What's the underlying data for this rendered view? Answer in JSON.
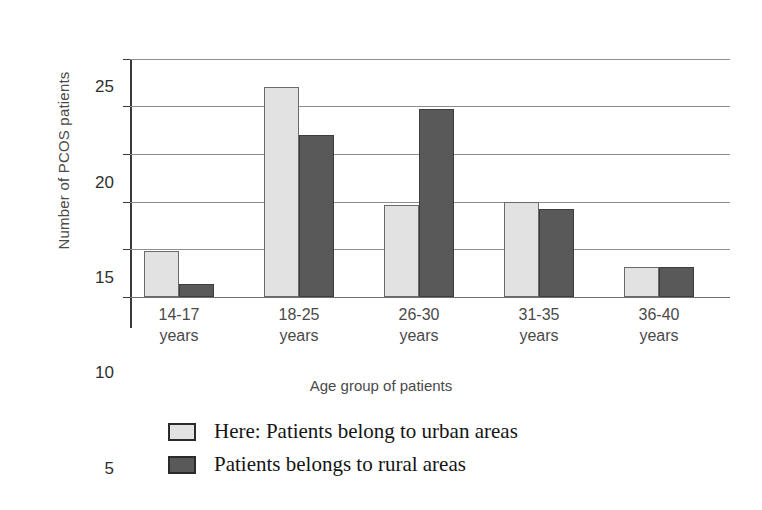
{
  "chart_data": {
    "type": "bar",
    "title": "",
    "xlabel": "Age group of patients",
    "ylabel": "Number of PCOS patients",
    "categories": [
      "14-17 years",
      "18-25 years",
      "26-30 years",
      "31-35 years",
      "36-40 years"
    ],
    "category_lines": [
      [
        "14-17",
        "years"
      ],
      [
        "18-25",
        "years"
      ],
      [
        "26-30",
        "years"
      ],
      [
        "31-35",
        "years"
      ],
      [
        "36-40",
        "years"
      ]
    ],
    "series": [
      {
        "name": "Here: Patients belong to urban areas",
        "short_name": "urban",
        "color": "#e2e2e2",
        "values": [
          4.8,
          22,
          9.7,
          10,
          3.2
        ]
      },
      {
        "name": "Patients belongs to rural areas",
        "short_name": "rural",
        "color": "#595959",
        "values": [
          1.4,
          17,
          19.7,
          9.2,
          3.2
        ]
      }
    ],
    "ylim": [
      0,
      28
    ],
    "yticks": [
      0,
      5,
      10,
      15,
      20,
      25
    ],
    "ytick_labels": [
      "0",
      "5",
      "10",
      "15",
      "20",
      "25"
    ],
    "grid": true,
    "grid_axis": "y",
    "legend_position": "bottom-left"
  },
  "legend": {
    "items": [
      {
        "label": "Here: Patients belong to urban areas",
        "swatch": "urban"
      },
      {
        "label": "Patients belongs to rural areas",
        "swatch": "rural"
      }
    ]
  },
  "axes": {
    "y_title": "Number of PCOS patients",
    "x_title": "Age group of patients"
  }
}
